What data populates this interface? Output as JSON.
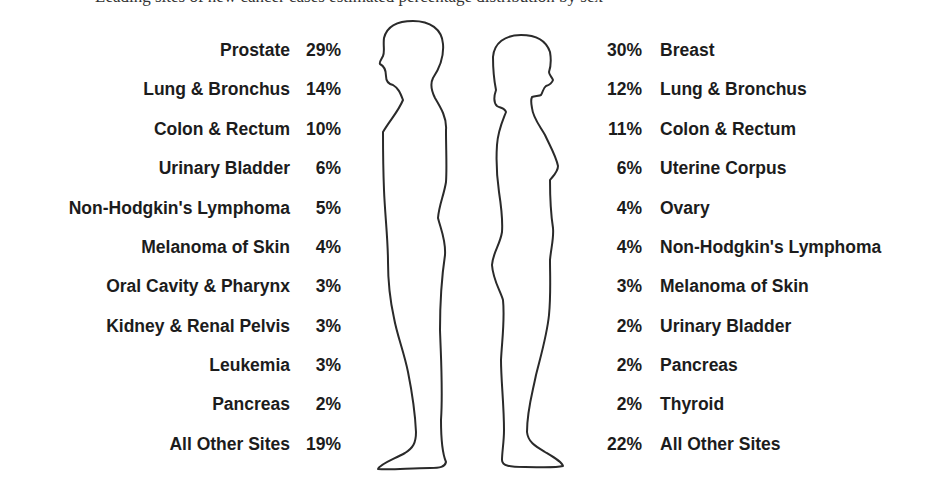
{
  "header": {
    "cutoff_text": "Leading sites of new cancer cases estimated percentage distribution by sex"
  },
  "figures": {
    "left": "male-silhouette",
    "right": "female-silhouette"
  },
  "colors": {
    "text": "#1c1c1c",
    "outline": "#2a2a2a",
    "background": "#ffffff"
  },
  "male": {
    "rows": [
      {
        "site": "Prostate",
        "pct": "29%"
      },
      {
        "site": "Lung & Bronchus",
        "pct": "14%"
      },
      {
        "site": "Colon & Rectum",
        "pct": "10%"
      },
      {
        "site": "Urinary Bladder",
        "pct": "6%"
      },
      {
        "site": "Non-Hodgkin's Lymphoma",
        "pct": "5%"
      },
      {
        "site": "Melanoma of Skin",
        "pct": "4%"
      },
      {
        "site": "Oral Cavity & Pharynx",
        "pct": "3%"
      },
      {
        "site": "Kidney & Renal Pelvis",
        "pct": "3%"
      },
      {
        "site": "Leukemia",
        "pct": "3%"
      },
      {
        "site": "Pancreas",
        "pct": "2%"
      },
      {
        "site": "All Other Sites",
        "pct": "19%"
      }
    ]
  },
  "female": {
    "rows": [
      {
        "site": "Breast",
        "pct": "30%"
      },
      {
        "site": "Lung & Bronchus",
        "pct": "12%"
      },
      {
        "site": "Colon & Rectum",
        "pct": "11%"
      },
      {
        "site": "Uterine Corpus",
        "pct": "6%"
      },
      {
        "site": "Ovary",
        "pct": "4%"
      },
      {
        "site": "Non-Hodgkin's Lymphoma",
        "pct": "4%"
      },
      {
        "site": "Melanoma of Skin",
        "pct": "3%"
      },
      {
        "site": "Urinary Bladder",
        "pct": "2%"
      },
      {
        "site": "Pancreas",
        "pct": "2%"
      },
      {
        "site": "Thyroid",
        "pct": "2%"
      },
      {
        "site": "All Other Sites",
        "pct": "22%"
      }
    ]
  }
}
